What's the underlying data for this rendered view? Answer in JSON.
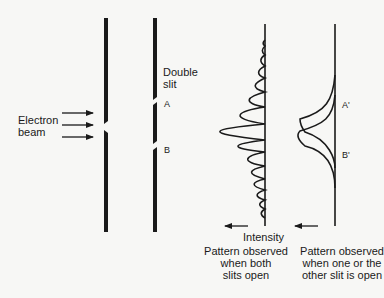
{
  "labels": {
    "electron_beam_line1": "Electron",
    "electron_beam_line2": "beam",
    "double_slit_line1": "Double",
    "double_slit_line2": "slit",
    "slit_a": "A",
    "slit_b": "B",
    "screen_a": "A'",
    "screen_b": "B'",
    "intensity": "Intensity"
  },
  "captions": {
    "both_open_line1": "Pattern observed",
    "both_open_line2": "when both",
    "both_open_line3": "slits open",
    "one_open_line1": "Pattern observed",
    "one_open_line2": "when one or the",
    "one_open_line3": "other slit is open"
  },
  "colors": {
    "background": "#f7f7f5",
    "ink": "#1a1a1a"
  }
}
